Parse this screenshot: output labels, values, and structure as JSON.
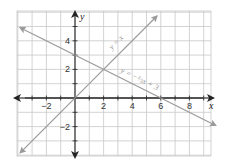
{
  "chart_data": {
    "type": "line",
    "title": "",
    "xlabel": "x",
    "ylabel": "y",
    "xlim": [
      -3.8,
      9.8
    ],
    "ylim": [
      -3.9,
      6.0
    ],
    "grid": true,
    "x_ticks": [
      -2,
      2,
      4,
      6,
      8
    ],
    "y_ticks": [
      -2,
      2,
      4
    ],
    "series": [
      {
        "name": "y = x",
        "label": "y = x",
        "equation": "y = x",
        "x": [
          -3.8,
          5.7
        ],
        "y": [
          -3.8,
          5.7
        ],
        "color": "#9a9a9a"
      },
      {
        "name": "y = -1/2 x + 3",
        "label": "y = −½x + 3",
        "equation": "y = -0.5x + 3",
        "x": [
          -3.8,
          9.8
        ],
        "y": [
          4.9,
          -1.9
        ],
        "color": "#9a9a9a"
      }
    ],
    "intersection": {
      "x": 2,
      "y": 2
    },
    "y_intercept_point": {
      "x": 0,
      "y": 3
    },
    "x_intercept_point": {
      "x": 6,
      "y": 0
    }
  },
  "labels": {
    "x_axis": "x",
    "y_axis": "y",
    "line1": "y = x",
    "line2": "y = −½x + 3"
  },
  "colors": {
    "grid": "#c8c8c8",
    "axis": "#222222",
    "lines": "#9a9a9a"
  }
}
